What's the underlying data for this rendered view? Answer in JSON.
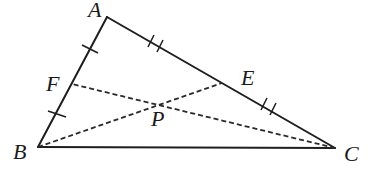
{
  "diagram": {
    "type": "triangle-with-cevians",
    "points": {
      "A": {
        "label": "A"
      },
      "B": {
        "label": "B"
      },
      "C": {
        "label": "C"
      },
      "E": {
        "label": "E"
      },
      "F": {
        "label": "F"
      },
      "P": {
        "label": "P"
      }
    },
    "segments": [
      {
        "from": "A",
        "to": "B",
        "style": "solid"
      },
      {
        "from": "A",
        "to": "C",
        "style": "solid"
      },
      {
        "from": "B",
        "to": "C",
        "style": "solid"
      },
      {
        "from": "B",
        "to": "E",
        "style": "dashed"
      },
      {
        "from": "C",
        "to": "F",
        "style": "dashed"
      }
    ],
    "tick_marks": [
      {
        "segment": "AF",
        "count": 1
      },
      {
        "segment": "FB",
        "count": 1
      },
      {
        "segment": "AE",
        "count": 2
      },
      {
        "segment": "EC",
        "count": 2
      }
    ],
    "relations": [
      "AF = FB",
      "AE = EC",
      "P = BE ∩ CF"
    ]
  }
}
